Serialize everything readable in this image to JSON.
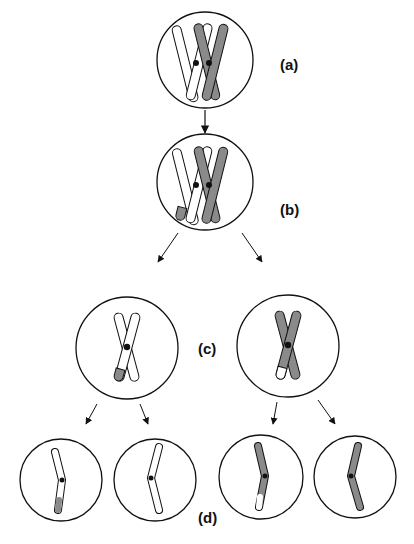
{
  "diagram": {
    "labels": {
      "a": "(a)",
      "b": "(b)",
      "c": "(c)",
      "d": "(d)"
    },
    "colors": {
      "outline": "#111111",
      "maternal_fill": "#ffffff",
      "paternal_fill": "#8a8a8a",
      "centromere": "#111111"
    },
    "stages": [
      {
        "id": "a",
        "description": "Paired homologous chromosomes (one white, one grey) each with two sister chromatids"
      },
      {
        "id": "b",
        "description": "Crossing over: tip segments exchanged between white and grey chromatids"
      },
      {
        "id": "c",
        "description": "Two daughter cells, each with one recombinant duplicated chromosome"
      },
      {
        "id": "d",
        "description": "Four cells, each with a single chromatid (two recombinant, two parental)"
      }
    ]
  }
}
